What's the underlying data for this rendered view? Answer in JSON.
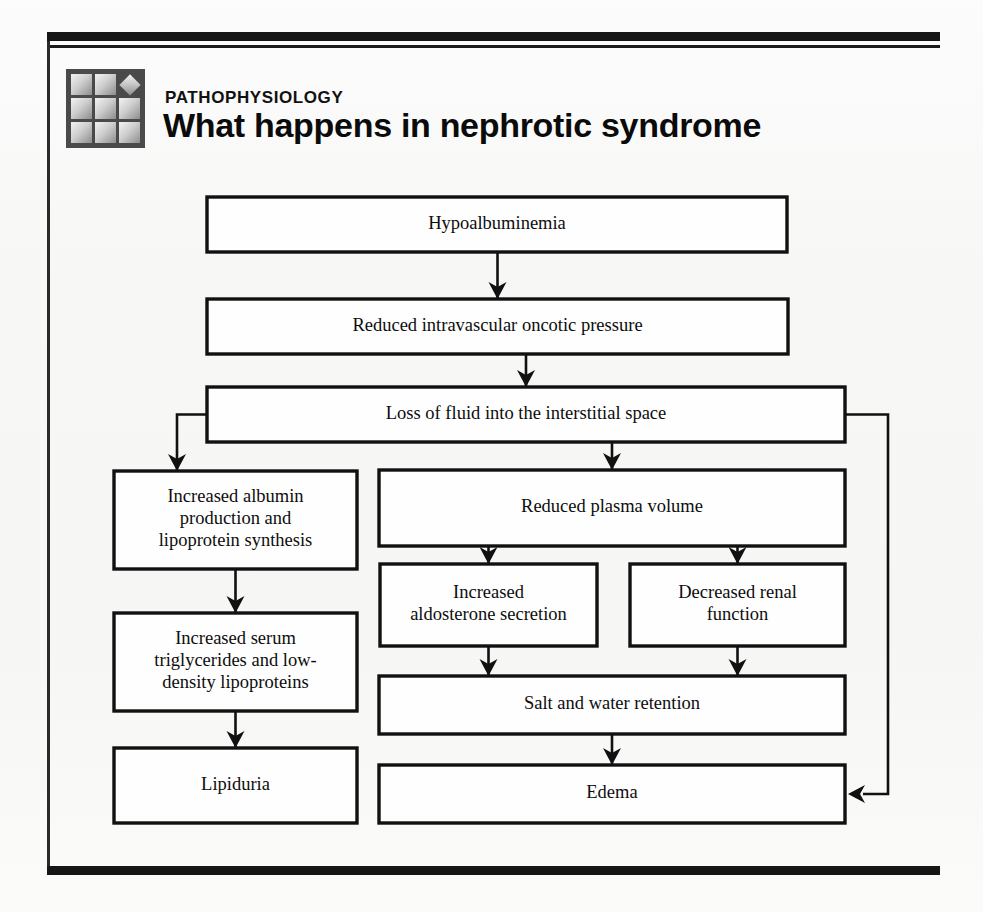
{
  "header": {
    "kicker": "PATHOPHYSIOLOGY",
    "title": "What happens in nephrotic syndrome",
    "logo_name": "pathophysiology-grid-logo"
  },
  "colors": {
    "ink": "#111111",
    "paper": "#f7f7f6",
    "box_fill": "#fefefe"
  },
  "chart_data": {
    "type": "diagram",
    "title": "What happens in nephrotic syndrome",
    "nodes": [
      {
        "id": "hypoalbuminemia",
        "label": "Hypoalbuminemia",
        "x": 207,
        "y": 197,
        "w": 580,
        "h": 55
      },
      {
        "id": "oncotic",
        "label": "Reduced intravascular oncotic pressure",
        "x": 207,
        "y": 299,
        "w": 581,
        "h": 55
      },
      {
        "id": "loss-fluid",
        "label": "Loss of fluid into the interstitial space",
        "x": 207,
        "y": 387,
        "w": 638,
        "h": 55
      },
      {
        "id": "albumin-production",
        "label": "Increased albumin\nproduction and\nlipoprotein synthesis",
        "x": 114,
        "y": 471,
        "w": 243,
        "h": 98
      },
      {
        "id": "plasma-volume",
        "label": "Reduced plasma volume",
        "x": 379,
        "y": 470,
        "w": 466,
        "h": 76
      },
      {
        "id": "aldosterone",
        "label": "Increased\naldosterone secretion",
        "x": 380,
        "y": 564,
        "w": 217,
        "h": 82
      },
      {
        "id": "renal-function",
        "label": "Decreased renal\nfunction",
        "x": 630,
        "y": 564,
        "w": 215,
        "h": 82
      },
      {
        "id": "triglycerides",
        "label": "Increased serum\ntriglycerides and low-\ndensity lipoproteins",
        "x": 114,
        "y": 613,
        "w": 243,
        "h": 98
      },
      {
        "id": "salt-water",
        "label": "Salt and water retention",
        "x": 379,
        "y": 676,
        "w": 466,
        "h": 58
      },
      {
        "id": "lipiduria",
        "label": "Lipiduria",
        "x": 114,
        "y": 748,
        "w": 243,
        "h": 75
      },
      {
        "id": "edema",
        "label": "Edema",
        "x": 379,
        "y": 765,
        "w": 466,
        "h": 58
      }
    ],
    "edges": [
      {
        "from": "hypoalbuminemia",
        "to": "oncotic",
        "kind": "straight-down"
      },
      {
        "from": "oncotic",
        "to": "loss-fluid",
        "kind": "straight-down"
      },
      {
        "from": "loss-fluid",
        "to": "albumin-production",
        "kind": "elbow-left"
      },
      {
        "from": "loss-fluid",
        "to": "plasma-volume",
        "kind": "straight-down"
      },
      {
        "from": "loss-fluid",
        "to": "edema",
        "kind": "elbow-right-bypass"
      },
      {
        "from": "plasma-volume",
        "to": "aldosterone",
        "kind": "straight-down"
      },
      {
        "from": "plasma-volume",
        "to": "renal-function",
        "kind": "straight-down"
      },
      {
        "from": "albumin-production",
        "to": "triglycerides",
        "kind": "straight-down"
      },
      {
        "from": "triglycerides",
        "to": "lipiduria",
        "kind": "straight-down"
      },
      {
        "from": "aldosterone",
        "to": "salt-water",
        "kind": "straight-down"
      },
      {
        "from": "renal-function",
        "to": "salt-water",
        "kind": "straight-down"
      },
      {
        "from": "salt-water",
        "to": "edema",
        "kind": "straight-down"
      }
    ]
  }
}
